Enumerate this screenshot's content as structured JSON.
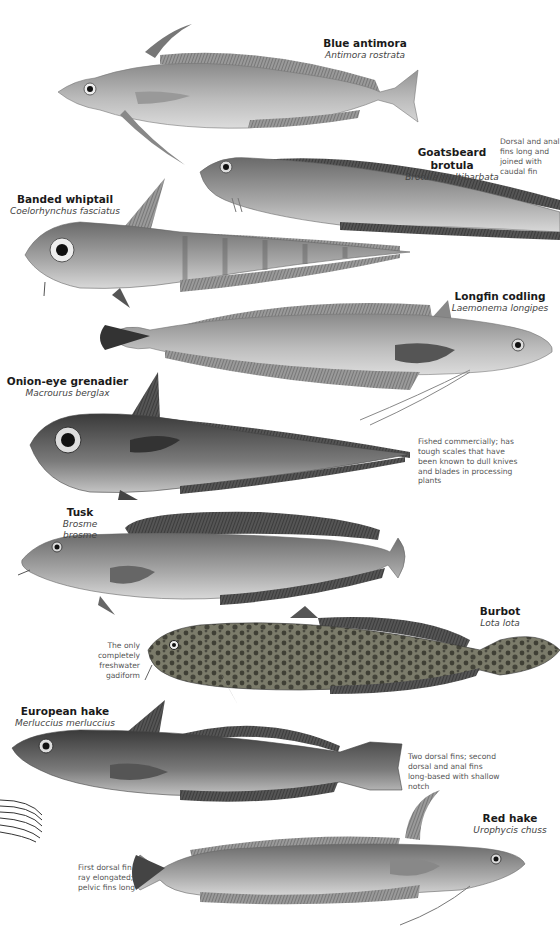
{
  "page": {
    "header_fragment": "",
    "background": "#ffffff"
  },
  "species": [
    {
      "common": "Blue antimora",
      "scientific": "Antimora rostrata"
    },
    {
      "common": "Goatsbeard brotula",
      "scientific": "Brotula multibarbata"
    },
    {
      "common": "Banded whiptail",
      "scientific": "Coelorhynchus fasciatus"
    },
    {
      "common": "Longfin codling",
      "scientific": "Laemonema longipes"
    },
    {
      "common": "Onion-eye grenadier",
      "scientific": "Macrourus berglax"
    },
    {
      "common": "Tusk",
      "scientific": "Brosme brosme"
    },
    {
      "common": "Burbot",
      "scientific": "Lota lota"
    },
    {
      "common": "European hake",
      "scientific": "Merluccius merluccius"
    },
    {
      "common": "Red hake",
      "scientific": "Urophycis chuss"
    }
  ],
  "notes": {
    "goatsbeard": "Dorsal and anal fins long and joined with caudal fin",
    "onion_eye": "Fished commercially; has tough scales that have been known to dull knives and blades in processing plants",
    "burbot": "The only completely freshwater gadiform",
    "hake": "Two dorsal fins; second dorsal and anal fins long-based with shallow notch",
    "red_hake": "First dorsal fin ray elongated; pelvic fins long"
  },
  "colors": {
    "text_primary": "#1a1a1a",
    "text_secondary": "#555555",
    "fish_light": "#bdbdbd",
    "fish_dark": "#4a4a4a"
  }
}
